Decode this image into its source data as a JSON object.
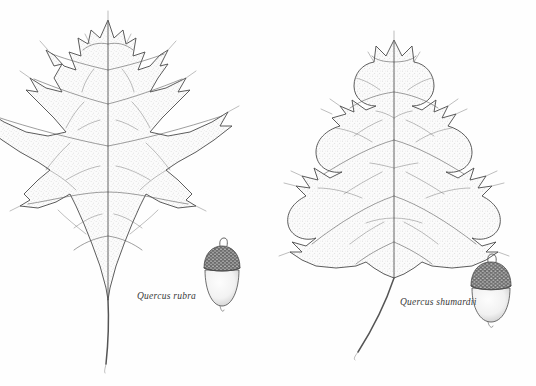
{
  "plate": {
    "kind": "botanical-illustration",
    "background_color": "#fefefe",
    "ink_color": "#4a4a4a",
    "blade_fill_color": "#fbfbfb",
    "stipple_color": "#8d8d8d",
    "cap_color": "#5a5a5a",
    "nut_color": "#f6f6f6"
  },
  "specimens": [
    {
      "id": "quercus-rubra",
      "label": "Quercus rubra",
      "common_layout": "left",
      "leaf": {
        "outline_style": "moderately-lobed",
        "lobes": 9,
        "sinus_depth": "shallow-to-moderate",
        "lobe_tips": "bristle-tipped",
        "petiole": "long, slender, slightly curved"
      },
      "acorn": {
        "shape": "ovoid",
        "cap_coverage": "shallow, about one third of nut",
        "cap_texture": "tight overlapping scales",
        "stem": "short stub"
      }
    },
    {
      "id": "quercus-shumardii",
      "label": "Quercus shumardii",
      "common_layout": "right",
      "leaf": {
        "outline_style": "deeply-lobed",
        "lobes": 9,
        "sinus_depth": "deep, nearly to midrib",
        "lobe_tips": "bristle-tipped, multi-toothed",
        "petiole": "long, slender, curved"
      },
      "acorn": {
        "shape": "broadly ovoid to rounded",
        "cap_coverage": "shallow bowl, about one quarter of nut",
        "cap_texture": "coarse overlapping scales",
        "stem": "short stub"
      }
    }
  ]
}
